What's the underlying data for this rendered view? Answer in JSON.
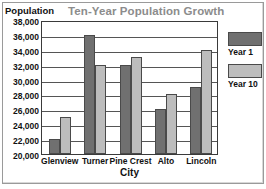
{
  "chart_data": {
    "type": "bar",
    "title": "Ten-Year Population Growth",
    "xlabel": "City",
    "ylabel": "Population",
    "categories": [
      "Glenview",
      "Turner",
      "Pine Crest",
      "Alto",
      "Lincoln"
    ],
    "series": [
      {
        "name": "Year 1",
        "color": "#707070",
        "values": [
          22000,
          36000,
          32000,
          26000,
          29000
        ]
      },
      {
        "name": "Year 10",
        "color": "#bdbdbd",
        "values": [
          25000,
          32000,
          33000,
          28000,
          34000
        ]
      }
    ],
    "ylim": [
      20000,
      38000
    ],
    "ytick_step": 2000,
    "ytick_labels": [
      "38,000",
      "36,000",
      "34,000",
      "32,000",
      "30,000",
      "28,000",
      "26,000",
      "24,000",
      "22,000",
      "20,000"
    ],
    "ytick_values": [
      38000,
      36000,
      34000,
      32000,
      30000,
      28000,
      26000,
      24000,
      22000,
      20000
    ],
    "grid": true,
    "legend_position": "right"
  },
  "legend": {
    "entries": [
      {
        "label": "Year 1",
        "swatch": "dark-gray-swatch"
      },
      {
        "label": "Year 10",
        "swatch": "light-gray-swatch"
      }
    ]
  }
}
